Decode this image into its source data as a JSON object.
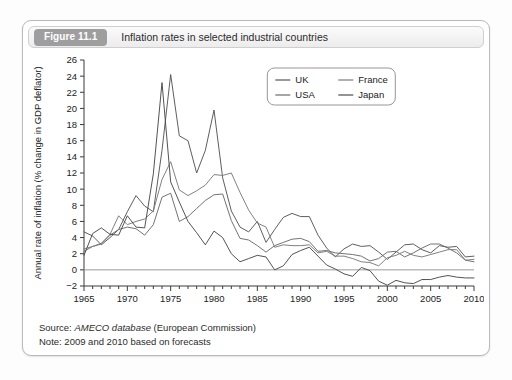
{
  "figure": {
    "badge": "Figure 11.1",
    "title": "Inflation rates in selected industrial countries"
  },
  "notes": {
    "source_prefix": "Source: ",
    "source_italic": "AMECO database",
    "source_suffix": " (European Commission)",
    "note": "Note: 2009 and 2010 based on forecasts"
  },
  "colors": {
    "uk": "#555555",
    "usa": "#6b6b6b",
    "france": "#7a7a7a",
    "japan": "#4a4a4a",
    "axis": "#3a3a3a",
    "zero_line": "#9a9a9a",
    "badge_bg": "#9e9e9e",
    "card_border": "#b9b9b9"
  },
  "chart_data": {
    "type": "line",
    "title": "Inflation rates in selected industrial countries",
    "xlabel": "",
    "ylabel": "Annual rate of inflation (% change in GDP deflator)",
    "xlim": [
      1965,
      2010
    ],
    "ylim": [
      -2,
      26
    ],
    "ytick_step": 2,
    "yticks": [
      -2,
      0,
      2,
      4,
      6,
      8,
      10,
      12,
      14,
      16,
      18,
      20,
      22,
      24,
      26
    ],
    "xticks": [
      1965,
      1970,
      1975,
      1980,
      1985,
      1990,
      1995,
      2000,
      2005,
      2010
    ],
    "xtick_minor_step": 1,
    "grid": false,
    "zero_line": true,
    "legend_position": "top-center",
    "x": [
      1965,
      1966,
      1967,
      1968,
      1969,
      1970,
      1971,
      1972,
      1973,
      1974,
      1975,
      1976,
      1977,
      1978,
      1979,
      1980,
      1981,
      1982,
      1983,
      1984,
      1985,
      1986,
      1987,
      1988,
      1989,
      1990,
      1991,
      1992,
      1993,
      1994,
      1995,
      1996,
      1997,
      1998,
      1999,
      2000,
      2001,
      2002,
      2003,
      2004,
      2005,
      2006,
      2007,
      2008,
      2009,
      2010
    ],
    "series": [
      {
        "name": "UK",
        "color": "#555555",
        "values": [
          4.7,
          4.2,
          3.1,
          4.0,
          5.0,
          7.2,
          9.2,
          7.9,
          7.2,
          14.8,
          24.2,
          16.6,
          16.0,
          12.0,
          14.8,
          19.8,
          11.4,
          7.3,
          5.3,
          4.7,
          6.0,
          3.4,
          5.0,
          6.5,
          7.0,
          6.6,
          6.6,
          4.3,
          2.7,
          1.6,
          2.6,
          3.2,
          2.9,
          3.0,
          2.2,
          1.3,
          2.2,
          3.1,
          3.2,
          2.5,
          2.1,
          3.0,
          2.8,
          2.9,
          1.6,
          1.7
        ]
      },
      {
        "name": "USA",
        "color": "#6b6b6b",
        "values": [
          2.3,
          2.9,
          3.2,
          4.3,
          5.0,
          5.3,
          5.1,
          4.3,
          5.6,
          9.0,
          9.5,
          6.0,
          6.6,
          7.6,
          8.6,
          9.3,
          9.4,
          6.1,
          3.9,
          3.7,
          3.0,
          2.2,
          3.0,
          3.4,
          3.8,
          3.9,
          3.5,
          2.3,
          2.4,
          2.1,
          2.0,
          1.9,
          1.7,
          1.1,
          1.4,
          2.2,
          2.3,
          1.6,
          2.1,
          2.7,
          3.2,
          3.2,
          2.7,
          2.1,
          1.2,
          1.0
        ]
      },
      {
        "name": "France",
        "color": "#7a7a7a",
        "values": [
          2.6,
          2.9,
          3.3,
          4.4,
          6.7,
          5.6,
          6.0,
          6.3,
          7.3,
          11.2,
          13.4,
          9.9,
          9.2,
          9.8,
          10.5,
          11.8,
          11.7,
          12.0,
          9.6,
          7.4,
          5.8,
          5.3,
          2.8,
          3.1,
          3.0,
          3.0,
          3.1,
          2.1,
          2.3,
          1.7,
          1.7,
          1.4,
          1.0,
          0.9,
          0.5,
          1.5,
          1.8,
          2.3,
          1.8,
          1.6,
          1.9,
          2.2,
          2.5,
          2.5,
          1.2,
          1.3
        ]
      },
      {
        "name": "Japan",
        "color": "#4a4a4a",
        "values": [
          1.8,
          4.5,
          5.2,
          4.4,
          4.3,
          6.7,
          5.3,
          5.2,
          11.9,
          23.2,
          10.9,
          8.4,
          6.0,
          4.6,
          3.1,
          4.8,
          4.0,
          2.0,
          1.0,
          1.4,
          1.8,
          1.6,
          0.0,
          0.5,
          1.9,
          2.4,
          2.8,
          1.7,
          0.6,
          0.1,
          -0.5,
          -0.8,
          0.3,
          -0.1,
          -1.4,
          -1.9,
          -1.3,
          -1.6,
          -1.7,
          -1.2,
          -1.2,
          -0.9,
          -0.7,
          -0.9,
          -1.0,
          -1.0
        ]
      }
    ],
    "legend": [
      "UK",
      "USA",
      "France",
      "Japan"
    ]
  }
}
